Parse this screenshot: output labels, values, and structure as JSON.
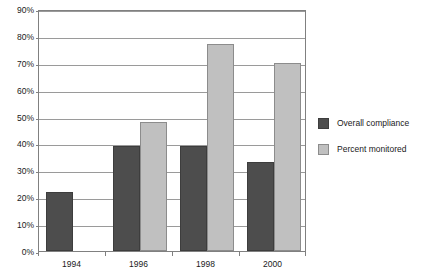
{
  "chart_data": {
    "type": "bar",
    "title": "",
    "subtitle": "",
    "xlabel": "",
    "ylabel": "",
    "categories": [
      "1994",
      "1996",
      "1998",
      "2000"
    ],
    "series": [
      {
        "name": "Overall compliance",
        "color": "#4d4d4d",
        "values": [
          22,
          39,
          39,
          33
        ]
      },
      {
        "name": "Percent monitored",
        "color": "#c0c0c0",
        "values": [
          null,
          48,
          77,
          70
        ]
      }
    ],
    "ylim": [
      0,
      90
    ],
    "ytick_step": 10,
    "ytick_labels": [
      "0%",
      "10%",
      "20%",
      "30%",
      "40%",
      "50%",
      "60%",
      "70%",
      "80%",
      "90%"
    ],
    "grid": true,
    "grid_axis": "y",
    "legend_position": "right",
    "value_suffix": "%"
  },
  "legend": {
    "entries": [
      {
        "label": "Overall compliance"
      },
      {
        "label": "Percent monitored"
      }
    ]
  },
  "colors": {
    "series_0": "#4d4d4d",
    "series_1": "#c0c0c0",
    "axis": "#808080",
    "gridline": "#9a9a9a",
    "text": "#1a1a1a",
    "background": "#ffffff"
  }
}
